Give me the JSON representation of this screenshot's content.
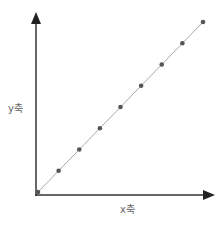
{
  "chart_data": {
    "type": "line",
    "title": "",
    "xlabel": "x축",
    "ylabel": "y축",
    "x": [
      0,
      1,
      2,
      3,
      4,
      5,
      6,
      7,
      8
    ],
    "series": [
      {
        "name": "y = x",
        "values": [
          0,
          1,
          2,
          3,
          4,
          5,
          6,
          7,
          8
        ],
        "color": "#555555",
        "line_color": "#aaaaaa"
      }
    ],
    "grid": false,
    "legend": "none",
    "ticks": "none",
    "axes_style": "arrows"
  },
  "labels": {
    "x": "x축",
    "y": "y축"
  },
  "colors": {
    "axis": "#333333",
    "line": "#aaaaaa",
    "marker": "#555555"
  }
}
